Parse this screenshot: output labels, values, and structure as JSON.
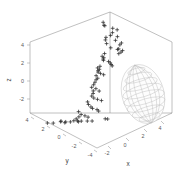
{
  "figure": {
    "kind": "3d-scatter-with-ellipsoid",
    "background_color": "#ffffff",
    "axis_line_color": "#8c8c8c",
    "marker_color": "#2b2b2b",
    "mesh_color": "#bdbdbd",
    "marker_symbol": "+"
  },
  "axes": {
    "x": {
      "label": "x",
      "ticks": [
        "-2",
        "0",
        "2",
        "4"
      ],
      "tick_values": [
        -2,
        0,
        2,
        4
      ],
      "range": [
        -4,
        5
      ]
    },
    "y": {
      "label": "y",
      "ticks": [
        "4",
        "2",
        "0",
        "-2",
        "-4"
      ],
      "tick_values": [
        4,
        2,
        0,
        -2,
        -4
      ],
      "range": [
        -5,
        5
      ]
    },
    "z": {
      "label": "z",
      "ticks": [
        "4",
        "2",
        "0",
        "-2"
      ],
      "tick_values": [
        4,
        2,
        0,
        -2
      ],
      "range": [
        -4,
        5
      ]
    }
  },
  "chart_data": {
    "type": "scatter",
    "title": "",
    "xlabel": "x",
    "ylabel": "y",
    "zlabel": "z",
    "xlim": [
      -4,
      5
    ],
    "ylim": [
      -5,
      5
    ],
    "zlim": [
      -4,
      5
    ],
    "grid": false,
    "legend": null,
    "series": [
      {
        "name": "samples",
        "marker": "+",
        "color": "#2b2b2b",
        "points": [
          [
            -0.4,
            1.2,
            4.6
          ],
          [
            0.2,
            0.9,
            4.3
          ],
          [
            0.5,
            1.6,
            4.0
          ],
          [
            1.4,
            -0.2,
            4.4
          ],
          [
            0.1,
            1.9,
            3.6
          ],
          [
            2.6,
            0.4,
            3.9
          ],
          [
            -1.2,
            2.2,
            3.2
          ],
          [
            0.8,
            1.1,
            3.4
          ],
          [
            2.1,
            -0.6,
            3.1
          ],
          [
            3.0,
            0.1,
            3.3
          ],
          [
            3.2,
            -0.3,
            3.0
          ],
          [
            3.1,
            0.5,
            2.7
          ],
          [
            -2.2,
            3.1,
            2.6
          ],
          [
            1.9,
            1.3,
            2.5
          ],
          [
            3.6,
            -1.2,
            2.4
          ],
          [
            4.1,
            -0.8,
            2.2
          ],
          [
            0.4,
            2.4,
            2.1
          ],
          [
            2.9,
            0.8,
            2.0
          ],
          [
            3.4,
            0.2,
            1.9
          ],
          [
            3.8,
            -0.4,
            1.8
          ],
          [
            -3.1,
            3.6,
            1.7
          ],
          [
            -2.6,
            2.9,
            1.5
          ],
          [
            -1.4,
            2.1,
            1.4
          ],
          [
            -1.0,
            1.7,
            1.3
          ],
          [
            -0.6,
            1.4,
            1.2
          ],
          [
            1.1,
            0.6,
            1.1
          ],
          [
            2.2,
            -0.1,
            1.0
          ],
          [
            3.3,
            -0.9,
            0.9
          ],
          [
            4.3,
            -1.6,
            0.8
          ],
          [
            -3.4,
            3.3,
            0.6
          ],
          [
            -2.9,
            2.6,
            0.5
          ],
          [
            -1.8,
            1.9,
            0.4
          ],
          [
            -1.5,
            1.5,
            0.3
          ],
          [
            -0.9,
            1.0,
            0.2
          ],
          [
            0.3,
            0.3,
            0.1
          ],
          [
            1.6,
            -0.4,
            0.0
          ],
          [
            -3.6,
            3.0,
            -0.2
          ],
          [
            -2.4,
            2.2,
            -0.4
          ],
          [
            -1.9,
            1.6,
            -0.5
          ],
          [
            -1.6,
            1.2,
            -0.7
          ],
          [
            -1.3,
            0.8,
            -0.9
          ],
          [
            -1.1,
            0.4,
            -1.1
          ],
          [
            0.6,
            -0.5,
            -1.2
          ],
          [
            1.8,
            -1.1,
            -1.4
          ],
          [
            -2.8,
            2.0,
            -1.5
          ],
          [
            -2.1,
            1.4,
            -1.7
          ],
          [
            -1.7,
            0.9,
            -1.9
          ],
          [
            0.9,
            -1.0,
            -2.0
          ],
          [
            2.4,
            -1.8,
            -2.1
          ],
          [
            3.7,
            -2.4,
            -2.2
          ],
          [
            -2.3,
            0.9,
            -2.4
          ],
          [
            -1.2,
            0.1,
            -2.6
          ],
          [
            0.0,
            -0.6,
            -2.8
          ],
          [
            1.2,
            -1.4,
            -2.9
          ],
          [
            2.7,
            -2.1,
            -3.0
          ],
          [
            3.9,
            -2.9,
            -3.1
          ],
          [
            -3.0,
            0.4,
            -3.2
          ],
          [
            -0.7,
            -1.2,
            -3.4
          ],
          [
            0.7,
            -1.9,
            -3.5
          ],
          [
            2.0,
            -2.6,
            -3.6
          ],
          [
            -3.8,
            1.1,
            -3.7
          ],
          [
            -2.5,
            -0.3,
            -3.8
          ],
          [
            -1.4,
            -1.5,
            -3.9
          ],
          [
            0.1,
            -2.3,
            -3.9
          ],
          [
            1.5,
            -3.0,
            -3.9
          ],
          [
            3.1,
            -3.6,
            -3.9
          ],
          [
            4.4,
            -4.1,
            -3.9
          ],
          [
            -4.1,
            -0.8,
            -3.9
          ],
          [
            -2.7,
            -2.0,
            -3.9
          ],
          [
            -1.0,
            -2.8,
            -3.9
          ],
          [
            0.4,
            -3.4,
            -3.9
          ],
          [
            2.3,
            -4.0,
            -3.9
          ],
          [
            -3.3,
            -3.1,
            -3.9
          ],
          [
            -1.6,
            -3.8,
            -3.9
          ],
          [
            0.8,
            -4.4,
            -3.9
          ],
          [
            2.8,
            -1.2,
            -3.9
          ],
          [
            4.0,
            -1.9,
            -3.9
          ]
        ]
      }
    ],
    "ellipsoid": {
      "center": [
        3.2,
        -1.4,
        -0.7
      ],
      "radii": [
        1.5,
        1.5,
        2.2
      ],
      "mesh": "wireframe",
      "color": "#bdbdbd"
    }
  }
}
